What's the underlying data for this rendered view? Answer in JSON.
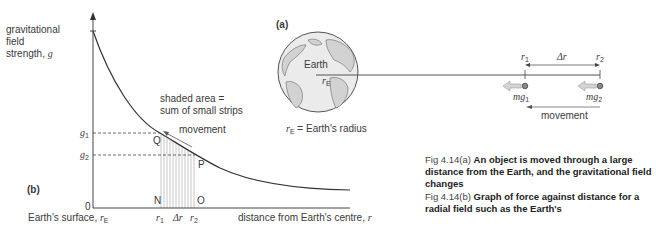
{
  "figure_a": {
    "panel_label": "(a)",
    "earth_label": "Earth",
    "radius_label": "r",
    "radius_sub": "E",
    "legend_symbol": "r",
    "legend_sub": "E",
    "legend_text": "= Earth's radius",
    "r1_label": "r",
    "r1_sub": "1",
    "r2_label": "r",
    "r2_sub": "2",
    "delta_r": "Δr",
    "force1_label": "mg",
    "force1_sub": "1",
    "force2_label": "mg",
    "force2_sub": "2",
    "movement_label": "movement"
  },
  "figure_b": {
    "panel_label": "(b)",
    "y_axis_label_line1": "gravitational",
    "y_axis_label_line2": "field",
    "y_axis_label_line3": "strength,",
    "y_axis_symbol": "g",
    "x_axis_label": "distance from Earth's centre,",
    "x_axis_symbol": "r",
    "origin_label": "0",
    "surface_label": "Earth's surface,",
    "surface_symbol": "r",
    "surface_sub": "E",
    "g1_label": "g",
    "g1_sub": "1",
    "g2_label": "g",
    "g2_sub": "2",
    "point_q": "Q",
    "point_p": "P",
    "point_n": "N",
    "point_o": "O",
    "r1_label": "r",
    "r1_sub": "1",
    "r2_label": "r",
    "r2_sub": "2",
    "delta_r": "Δr",
    "shaded_note_line1": "shaded area =",
    "shaded_note_line2": "sum of small strips",
    "movement_label": "movement"
  },
  "captions": [
    {
      "label": "Fig 4.14(a)",
      "text": "An object is moved through a large distance from the Earth, and the gravitational field changes"
    },
    {
      "label": "Fig 4.14(b)",
      "text": "Graph of force against distance for a radial field such as the Earth's"
    }
  ],
  "colors": {
    "line": "#333333",
    "strip": "#b8b8b8",
    "earth_fill": "#e6e6e6",
    "land": "#cfcfcf",
    "arrow_fill": "#d4d4d4"
  }
}
